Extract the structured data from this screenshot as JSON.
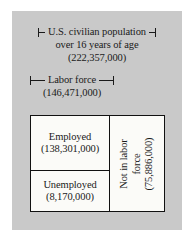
{
  "figure": {
    "panel_color": "#c9c9c9",
    "box_fill": "#fbfbf8",
    "line_color": "#111111"
  },
  "population": {
    "bracket_label": "U.S. civilian population",
    "line2": "over 16 years of age",
    "value": "(222,357,000)"
  },
  "labor_force": {
    "bracket_label": "Labor force",
    "value": "(146,471,000)"
  },
  "box": {
    "employed": {
      "label": "Employed",
      "value": "(138,301,000)"
    },
    "unemployed": {
      "label": "Unemployed",
      "value": "(8,170,000)"
    },
    "not_in_labor_force": {
      "label_line1": "Not in labor",
      "label_line2": "force",
      "value": "(75,886,000)"
    }
  }
}
